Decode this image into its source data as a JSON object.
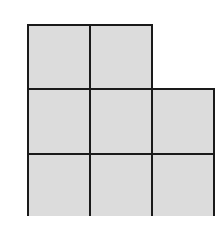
{
  "diagram": {
    "type": "grid-polyomino",
    "rows": [
      {
        "cells": 2
      },
      {
        "cells": 3
      },
      {
        "cells": 3
      }
    ],
    "fill_color": "#dcdcdc",
    "line_color": "#1a1a1a",
    "cell_size_px": 62,
    "origin": {
      "x": 27,
      "y": 24
    }
  }
}
